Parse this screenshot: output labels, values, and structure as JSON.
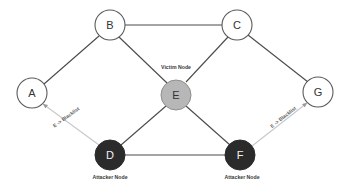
{
  "diagram": {
    "type": "network-graph",
    "background_color": "#ffffff",
    "canvas": {
      "width": 349,
      "height": 192
    },
    "colors": {
      "edge_solid": "#4a4a4a",
      "edge_arrow": "#c8c8c8",
      "node_open_fill": "#ffffff",
      "node_open_stroke": "#5a5a5a",
      "victim_fill": "#b7b7b7",
      "attacker_fill": "#2b2b2b",
      "label_dark": "#333333",
      "label_light": "#f2f2f2"
    },
    "nodes": [
      {
        "id": "A",
        "label": "A",
        "x": 32,
        "y": 93,
        "r": 15,
        "style": "open",
        "role": ""
      },
      {
        "id": "B",
        "label": "B",
        "x": 110,
        "y": 25,
        "r": 15,
        "style": "open",
        "role": ""
      },
      {
        "id": "C",
        "label": "C",
        "x": 237,
        "y": 25,
        "r": 15,
        "style": "open",
        "role": ""
      },
      {
        "id": "D",
        "label": "D",
        "x": 110,
        "y": 155,
        "r": 15,
        "style": "attacker",
        "role": "Attacker Node"
      },
      {
        "id": "E",
        "label": "E",
        "x": 176,
        "y": 95,
        "r": 15,
        "style": "victim",
        "role": "Victim Node"
      },
      {
        "id": "F",
        "label": "F",
        "x": 240,
        "y": 155,
        "r": 15,
        "style": "attacker",
        "role": "Attacker Node"
      },
      {
        "id": "G",
        "label": "G",
        "x": 318,
        "y": 92,
        "r": 15,
        "style": "open",
        "role": ""
      }
    ],
    "edges": [
      {
        "from": "A",
        "to": "B",
        "kind": "link",
        "label": ""
      },
      {
        "from": "B",
        "to": "C",
        "kind": "link",
        "label": ""
      },
      {
        "from": "B",
        "to": "E",
        "kind": "link",
        "label": ""
      },
      {
        "from": "C",
        "to": "E",
        "kind": "link",
        "label": ""
      },
      {
        "from": "C",
        "to": "G",
        "kind": "link",
        "label": ""
      },
      {
        "from": "D",
        "to": "E",
        "kind": "link",
        "label": ""
      },
      {
        "from": "E",
        "to": "F",
        "kind": "link",
        "label": ""
      },
      {
        "from": "D",
        "to": "F",
        "kind": "link",
        "label": ""
      },
      {
        "from": "D",
        "to": "A",
        "kind": "arrow",
        "label": "E -> Blacklist"
      },
      {
        "from": "F",
        "to": "G",
        "kind": "arrow",
        "label": "E -> Blacklist"
      }
    ],
    "captions": {
      "victim_node": "Victim Node",
      "attacker_node_d": "Attacker Node",
      "attacker_node_f": "Attacker Node",
      "blacklist_left": "E -> Blacklist",
      "blacklist_right": "E -> Blacklist"
    },
    "node_labels": {
      "a": "A",
      "b": "B",
      "c": "C",
      "d": "D",
      "e": "E",
      "f": "F",
      "g": "G"
    }
  }
}
